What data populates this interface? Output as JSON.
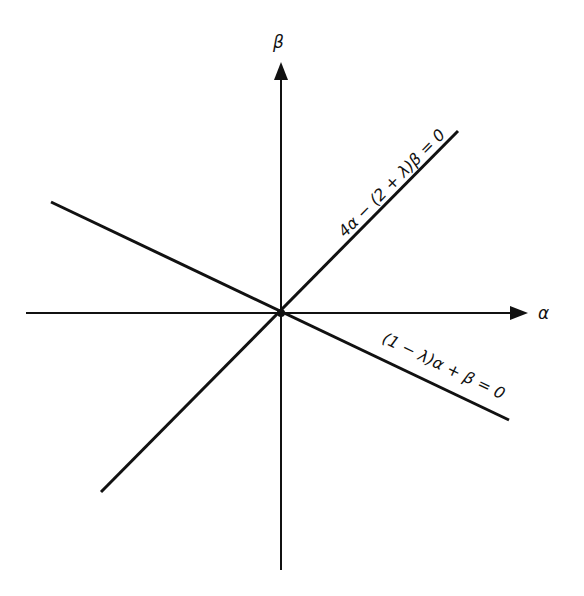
{
  "diagram": {
    "type": "coordinate-plane-with-lines",
    "colors": {
      "stroke": "#111111",
      "background": "#ffffff"
    },
    "axes": {
      "x_label": "α",
      "y_label": "β"
    },
    "lines": [
      {
        "id": "line-positive-slope",
        "label": "4α − (2 + λ)β = 0"
      },
      {
        "id": "line-negative-slope",
        "label": "(1 − λ)α + β = 0"
      }
    ],
    "origin_marker": "dot at intersection"
  }
}
